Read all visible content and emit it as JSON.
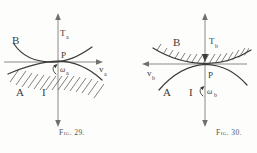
{
  "document": {
    "kind": "textbook-figure-pair",
    "background_color": "#fdfdfc",
    "ink_color": "#3a3a38",
    "axis_color": "#8a8a88"
  },
  "figures": [
    {
      "id": "fig-29",
      "caption": "Fig. 29.",
      "axes": {
        "vertical": {
          "label": "T",
          "subscript": "a",
          "arrow_direction": "up"
        },
        "horizontal": {
          "label": "v",
          "subscript": "a",
          "arrow_direction": "right"
        }
      },
      "curves": [
        {
          "name": "B",
          "label": "B",
          "position": "upper-left"
        },
        {
          "name": "A",
          "label": "A",
          "position": "lower-left"
        }
      ],
      "contact_point": {
        "label": "P",
        "position": "above-right-of-origin"
      },
      "hatching": {
        "side": "below",
        "description": "hatched band beneath contact curve"
      },
      "annotations": [
        {
          "name": "current-symbol",
          "label": "I"
        },
        {
          "name": "angular-velocity",
          "label": "ω",
          "subscript": "a",
          "arrow": "curved"
        }
      ]
    },
    {
      "id": "fig-30",
      "caption": "Fig. 30.",
      "axes": {
        "vertical": {
          "label": "T",
          "subscript": "b",
          "arrow_direction": "down"
        },
        "horizontal": {
          "label": "v",
          "subscript": "b",
          "arrow_direction": "left"
        }
      },
      "curves": [
        {
          "name": "B",
          "label": "B",
          "position": "upper-left"
        },
        {
          "name": "A",
          "label": "A",
          "position": "lower-left"
        }
      ],
      "contact_point": {
        "label": "P",
        "position": "below-right-of-origin"
      },
      "hatching": {
        "side": "above",
        "description": "hatched band above contact curve"
      },
      "annotations": [
        {
          "name": "current-symbol",
          "label": "I"
        },
        {
          "name": "angular-velocity",
          "label": "ω",
          "subscript": "b",
          "arrow": "curved"
        }
      ]
    }
  ]
}
